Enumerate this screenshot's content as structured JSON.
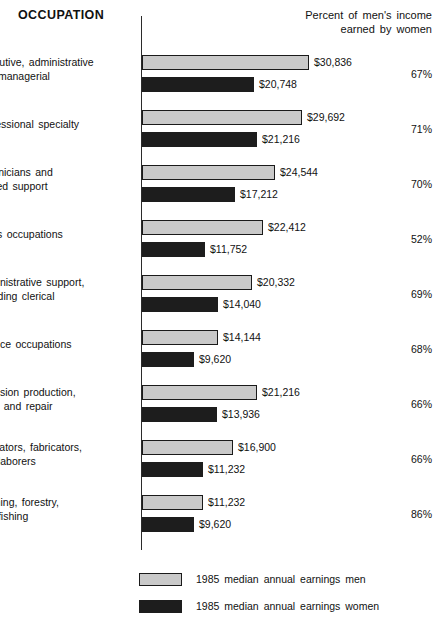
{
  "header": {
    "title": "OCCUPATION",
    "pct_header_line1": "Percent of men's income",
    "pct_header_line2": "earned by women"
  },
  "legend": {
    "men_label": "1985 median annual earnings men",
    "women_label": "1985 median annual earnings women"
  },
  "colors": {
    "men_fill": "#c9c9c9",
    "women_fill": "#1d1d1d",
    "outline": "#1a1a1a",
    "text": "#111111"
  },
  "chart_data": {
    "type": "bar",
    "title": "OCCUPATION",
    "orientation": "horizontal",
    "grouped": true,
    "xlabel": "",
    "ylabel": "",
    "xlim": [
      0,
      32000
    ],
    "grid": false,
    "legend_position": "bottom-left",
    "categories": [
      "Executive, administrative and managerial",
      "Professional specialty",
      "Technicians and related support",
      "Sales occupations",
      "Administrative support, including clerical",
      "Service occupations",
      "Precision production, craft, and repair",
      "Operators, fabricators, and laborers",
      "Farming, forestry, and fishing"
    ],
    "series": [
      {
        "name": "1985 median annual earnings men",
        "values": [
          30836,
          29692,
          24544,
          22412,
          20332,
          14144,
          21216,
          16900,
          11232
        ]
      },
      {
        "name": "1985 median annual earnings women",
        "values": [
          20748,
          21216,
          17212,
          11752,
          14040,
          9620,
          13936,
          11232,
          9620
        ]
      }
    ],
    "annotations": {
      "percent_of_mens_income_earned_by_women": [
        "67%",
        "71%",
        "70%",
        "52%",
        "69%",
        "68%",
        "66%",
        "66%",
        "86%"
      ]
    }
  },
  "rows": [
    {
      "label_lines": [
        "Executive, administrative",
        "and managerial"
      ],
      "men_value": "$30,836",
      "women_value": "$20,748",
      "men_num": 30836,
      "women_num": 20748,
      "percent": "67%"
    },
    {
      "label_lines": [
        "Professional specialty"
      ],
      "men_value": "$29,692",
      "women_value": "$21,216",
      "men_num": 29692,
      "women_num": 21216,
      "percent": "71%"
    },
    {
      "label_lines": [
        "Technicians and",
        "related support"
      ],
      "men_value": "$24,544",
      "women_value": "$17,212",
      "men_num": 24544,
      "women_num": 17212,
      "percent": "70%"
    },
    {
      "label_lines": [
        "Sales occupations"
      ],
      "men_value": "$22,412",
      "women_value": "$11,752",
      "men_num": 22412,
      "women_num": 11752,
      "percent": "52%"
    },
    {
      "label_lines": [
        "Administrative support,",
        "including clerical"
      ],
      "men_value": "$20,332",
      "women_value": "$14,040",
      "men_num": 20332,
      "women_num": 14040,
      "percent": "69%"
    },
    {
      "label_lines": [
        "Service occupations"
      ],
      "men_value": "$14,144",
      "women_value": "$9,620",
      "men_num": 14144,
      "women_num": 9620,
      "percent": "68%"
    },
    {
      "label_lines": [
        "Precision production,",
        "craft, and repair"
      ],
      "men_value": "$21,216",
      "women_value": "$13,936",
      "men_num": 21216,
      "women_num": 13936,
      "percent": "66%"
    },
    {
      "label_lines": [
        "Operators, fabricators,",
        "and laborers"
      ],
      "men_value": "$16,900",
      "women_value": "$11,232",
      "men_num": 16900,
      "women_num": 11232,
      "percent": "66%"
    },
    {
      "label_lines": [
        "Farming, forestry,",
        "and fishing"
      ],
      "men_value": "$11,232",
      "women_value": "$9,620",
      "men_num": 11232,
      "women_num": 9620,
      "percent": "86%"
    }
  ],
  "scale": {
    "axis_x_px": 142,
    "px_per_dollar": 0.0054,
    "group_top_px": 52,
    "group_pitch_px": 55
  }
}
